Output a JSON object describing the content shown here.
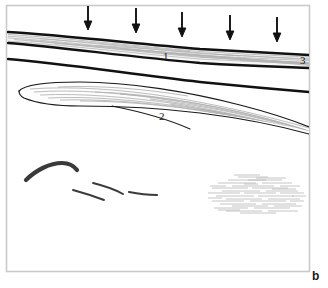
{
  "figure": {
    "panel_letter": "b",
    "frame": {
      "x": 6,
      "y": 5,
      "width": 304,
      "height": 267,
      "border_color": "#c9c9c9",
      "background_color": "#ffffff"
    },
    "ink_color": "#111111",
    "striation_color": "#b5b5b5",
    "labels": [
      {
        "text": "1",
        "x": 164,
        "y": 57,
        "name": "layer-label-1"
      },
      {
        "text": "2",
        "x": 160,
        "y": 117,
        "name": "layer-label-2"
      },
      {
        "text": "3",
        "x": 301,
        "y": 61,
        "name": "layer-label-3"
      }
    ],
    "arrows": {
      "count": 5,
      "direction": "down",
      "color": "#111111",
      "items": [
        {
          "x": 88,
          "y_top": 5,
          "y_tip": 29
        },
        {
          "x": 136,
          "y_top": 8,
          "y_tip": 32
        },
        {
          "x": 182,
          "y_top": 12,
          "y_tip": 36
        },
        {
          "x": 230,
          "y_top": 15,
          "y_tip": 39
        },
        {
          "x": 277,
          "y_top": 17,
          "y_tip": 41
        }
      ]
    },
    "strata": {
      "unit_1_band": {
        "name": "laminated-band-unit-1",
        "top_path": "M 8,32 C 60,35 130,43 200,49 C 250,52 285,54 309,55",
        "bottom_path": "M 8,43 C 60,47 130,57 200,63 C 250,66 285,67 309,68",
        "fill": "#f4f4f4"
      },
      "unit_3_line": {
        "name": "contact-line-unit-3",
        "path": "M 8,59 C 60,63 130,74 200,82 C 250,87 285,90 309,92"
      },
      "unit_2_lens": {
        "name": "lens-unit-2",
        "outline": "M 19,91 C 24,85 45,82 80,82 C 130,82 190,92 240,105 C 275,114 296,122 309,128 L 309,131 C 280,124 240,116 200,112 C 160,108 110,106 80,106 C 55,106 30,102 20,97 Z",
        "tail": "M 120,107 C 150,113 175,120 192,128"
      }
    },
    "sketch_marks": [
      {
        "name": "dark-stroke-mark-1",
        "path": "M 25,180 C 35,170 50,163 62,163 C 70,163 74,166 76,170",
        "weight": 4.2
      },
      {
        "name": "dark-stroke-mark-2",
        "path": "M 72,190 C 84,193 96,197 104,199",
        "weight": 2.0
      },
      {
        "name": "dark-stroke-mark-3",
        "path": "M 92,183 C 104,186 115,190 122,193",
        "weight": 2.0
      },
      {
        "name": "dark-stroke-mark-4",
        "path": "M 128,192 C 138,194 148,195 156,195",
        "weight": 2.2
      }
    ],
    "hatch_cluster": {
      "name": "fine-hatch-cluster",
      "x": 208,
      "y": 176,
      "width": 98,
      "height": 38,
      "color": "#bdbdbd",
      "line_count": 38
    }
  }
}
